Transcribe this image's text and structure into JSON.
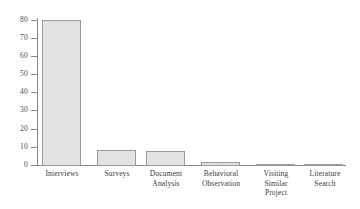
{
  "chart_data": {
    "type": "bar",
    "title": "",
    "subtitle": "",
    "xlabel": "",
    "ylabel": "",
    "ylim": [
      0,
      80
    ],
    "yticks": [
      0,
      10,
      20,
      30,
      40,
      50,
      60,
      70,
      80
    ],
    "grid": false,
    "legend": false,
    "categories": [
      "Interviews",
      "Surveys",
      "Document Analysis",
      "Behavioral Observation",
      "Visiting Similar Project",
      "Literature Search"
    ],
    "category_lines": [
      [
        "Interviews"
      ],
      [
        "Surveys"
      ],
      [
        "Document",
        "Analysis"
      ],
      [
        "Behavioral",
        "Observation"
      ],
      [
        "Visiting",
        "Similar",
        "Project"
      ],
      [
        "Literature",
        "Search"
      ]
    ],
    "values": [
      80,
      9,
      8,
      2,
      1,
      1
    ],
    "colors": {
      "bar_fill": "#e2e2e2",
      "bar_border": "#9a9a9a",
      "axis": "#8a8a8a",
      "text": "#3b3b3b",
      "background": "#ffffff"
    }
  }
}
